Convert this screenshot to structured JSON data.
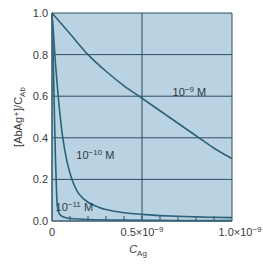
{
  "chart_data": {
    "type": "line",
    "title": "",
    "xlabel": "C_Ag",
    "ylabel": "[AbAg+]/C_Ab",
    "xlim": [
      0,
      1e-09
    ],
    "ylim": [
      0,
      1.0
    ],
    "grid": true,
    "legend_position": "inline",
    "x_ticks": [
      {
        "value": 0,
        "label": "0"
      },
      {
        "value": 5e-10,
        "label": "0.5×10⁻⁹"
      },
      {
        "value": 1e-09,
        "label": "1.0×10⁻⁹"
      }
    ],
    "y_ticks": [
      {
        "value": 0.0,
        "label": "0.0"
      },
      {
        "value": 0.2,
        "label": "0.2"
      },
      {
        "value": 0.4,
        "label": "0.4"
      },
      {
        "value": 0.6,
        "label": "0.6"
      },
      {
        "value": 0.8,
        "label": "0.8"
      },
      {
        "value": 1.0,
        "label": "1.0"
      }
    ],
    "minor_x_tick_step": 1e-10,
    "series": [
      {
        "name": "10⁻⁹ M",
        "x": [
          0,
          1e-10,
          2e-10,
          3e-10,
          4e-10,
          5e-10,
          6e-10,
          7e-10,
          8e-10,
          9e-10,
          1e-09
        ],
        "values": [
          1.0,
          0.9,
          0.8,
          0.72,
          0.65,
          0.59,
          0.53,
          0.47,
          0.41,
          0.35,
          0.3
        ],
        "label_pos": {
          "x": 6.7e-10,
          "y": 0.6
        }
      },
      {
        "name": "10⁻¹⁰ M",
        "x": [
          0,
          1e-11,
          2e-11,
          4e-11,
          6e-11,
          8e-11,
          1e-10,
          1.2e-10,
          1.5e-10,
          2e-10,
          2.5e-10,
          3e-10,
          4e-10,
          5e-10,
          6e-10,
          8e-10,
          1e-09
        ],
        "values": [
          1.0,
          0.88,
          0.75,
          0.55,
          0.4,
          0.3,
          0.23,
          0.18,
          0.13,
          0.09,
          0.07,
          0.055,
          0.04,
          0.032,
          0.026,
          0.02,
          0.016
        ],
        "label_pos": {
          "x": 1.35e-10,
          "y": 0.3
        }
      },
      {
        "name": "10⁻¹¹ M",
        "x": [
          0,
          5e-12,
          1e-11,
          1.5e-11,
          2e-11,
          2.5e-11,
          3e-11,
          4e-11,
          6e-11,
          1e-10,
          2e-10,
          4e-10,
          6e-10,
          8e-10,
          1e-09
        ],
        "values": [
          1.0,
          0.85,
          0.65,
          0.45,
          0.28,
          0.15,
          0.07,
          0.035,
          0.02,
          0.012,
          0.007,
          0.004,
          0.003,
          0.002,
          0.002
        ],
        "label_pos": {
          "x": 2e-11,
          "y": 0.05
        }
      }
    ]
  },
  "labels": {
    "y_axis": "[AbAg⁺]/C",
    "y_axis_sub": "Ab",
    "x_axis": "C",
    "x_axis_sub": "Ag"
  },
  "colors": {
    "plot_bg": "#b9d3e2",
    "grid": "#2f4f63",
    "curve": "#2e627a",
    "frame": "#3d6277"
  }
}
